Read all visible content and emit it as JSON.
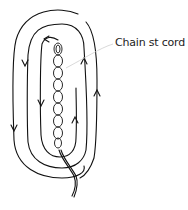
{
  "diagram": {
    "type": "crochet-technique-illustration",
    "label": "Chain st cord",
    "colors": {
      "line": "#111111",
      "leader_line": "#c8c8c8",
      "background": "#ffffff"
    },
    "rounds": [
      {
        "name": "inner-round",
        "direction_left_side": "down",
        "direction_right_side": "up"
      },
      {
        "name": "middle-round",
        "direction_left_side": "down",
        "direction_right_side": "up"
      },
      {
        "name": "outer-round",
        "direction_left_side": "down",
        "direction_right_side": "up"
      }
    ],
    "icons": [
      "arrow-down-icon",
      "arrow-up-icon",
      "arrow-left-icon"
    ]
  }
}
